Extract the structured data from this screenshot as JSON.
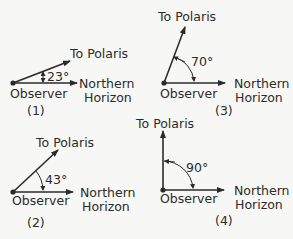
{
  "panels": [
    {
      "number": "(1)",
      "angle": "23°",
      "polaris_label": "To Polaris",
      "observer_label": "Observer",
      "horizon_label_line1": "Northern",
      "horizon_label_line2": "Horizon"
    },
    {
      "number": "(2)",
      "angle": "43°",
      "polaris_label": "To Polaris",
      "observer_label": "Observer",
      "horizon_label_line1": "Northern",
      "horizon_label_line2": "Horizon"
    },
    {
      "number": "(3)",
      "angle": "70°",
      "polaris_label": "To Polaris",
      "observer_label": "Observer",
      "horizon_label_line1": "Northern",
      "horizon_label_line2": "Horizon"
    },
    {
      "number": "(4)",
      "angle": "90°",
      "polaris_label": "To Polaris",
      "observer_label": "Observer",
      "horizon_label_line1": "Northern",
      "horizon_label_line2": "Horizon"
    }
  ]
}
